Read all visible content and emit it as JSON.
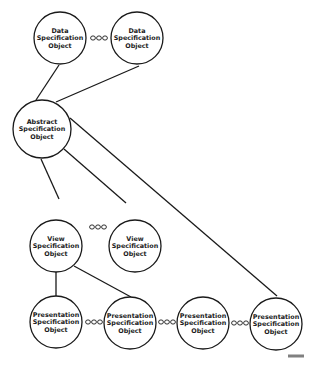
{
  "diagram": {
    "nodes": [
      {
        "id": "data1",
        "lines": [
          "Data",
          "Specification",
          "Object"
        ],
        "cx": 60,
        "cy": 38,
        "r": 26
      },
      {
        "id": "data2",
        "lines": [
          "Data",
          "Specification",
          "Object"
        ],
        "cx": 137,
        "cy": 38,
        "r": 26
      },
      {
        "id": "abstract",
        "lines": [
          "Abstract",
          "Specification",
          "Object"
        ],
        "cx": 42,
        "cy": 129,
        "r": 29
      },
      {
        "id": "view1",
        "lines": [
          "View",
          "Specification",
          "Object"
        ],
        "cx": 56,
        "cy": 246,
        "r": 26
      },
      {
        "id": "view2",
        "lines": [
          "View",
          "Specification",
          "Object"
        ],
        "cx": 135,
        "cy": 246,
        "r": 26
      },
      {
        "id": "pres1",
        "lines": [
          "Presentation",
          "Specification",
          "Object"
        ],
        "cx": 56,
        "cy": 322,
        "r": 26
      },
      {
        "id": "pres2",
        "lines": [
          "Presentation",
          "Specification",
          "Object"
        ],
        "cx": 130,
        "cy": 323,
        "r": 26
      },
      {
        "id": "pres3",
        "lines": [
          "Presentation",
          "Specification",
          "Object"
        ],
        "cx": 203,
        "cy": 323,
        "r": 26
      },
      {
        "id": "pres4",
        "lines": [
          "Presentation",
          "Specification",
          "Object"
        ],
        "cx": 276,
        "cy": 324,
        "r": 26
      }
    ],
    "edges": [
      {
        "from": "data1",
        "to": "abstract",
        "x1": 59,
        "y1": 65,
        "x2": 36,
        "y2": 100
      },
      {
        "from": "data2",
        "to": "abstract",
        "x1": 139,
        "y1": 66,
        "x2": 56,
        "y2": 102
      },
      {
        "from": "abstract",
        "to": "view1",
        "x1": 41,
        "y1": 159,
        "x2": 59,
        "y2": 199
      },
      {
        "from": "abstract",
        "to": "view2",
        "x1": 64,
        "y1": 149,
        "x2": 126,
        "y2": 203
      },
      {
        "from": "abstract",
        "to": "pres4",
        "x1": 70,
        "y1": 118,
        "x2": 277,
        "y2": 296
      },
      {
        "from": "view1",
        "to": "pres1",
        "x1": 56,
        "y1": 272,
        "x2": 56,
        "y2": 296
      },
      {
        "from": "view1",
        "to": "pres2",
        "x1": 74,
        "y1": 266,
        "x2": 131,
        "y2": 297
      }
    ],
    "ellipses": [
      {
        "between": [
          "data1",
          "data2"
        ],
        "x": 99,
        "y": 38,
        "label": "ooo"
      },
      {
        "between": [
          "view1",
          "view2"
        ],
        "x": 98,
        "y": 227,
        "label": "ooo"
      },
      {
        "between": [
          "pres1",
          "pres2"
        ],
        "x": 94,
        "y": 322,
        "label": "ooo"
      },
      {
        "between": [
          "pres2",
          "pres3"
        ],
        "x": 167,
        "y": 322,
        "label": "ooo"
      },
      {
        "between": [
          "pres3",
          "pres4"
        ],
        "x": 240,
        "y": 323,
        "label": "ooo"
      }
    ],
    "figure_id": {
      "x": 302,
      "y": 357
    }
  }
}
